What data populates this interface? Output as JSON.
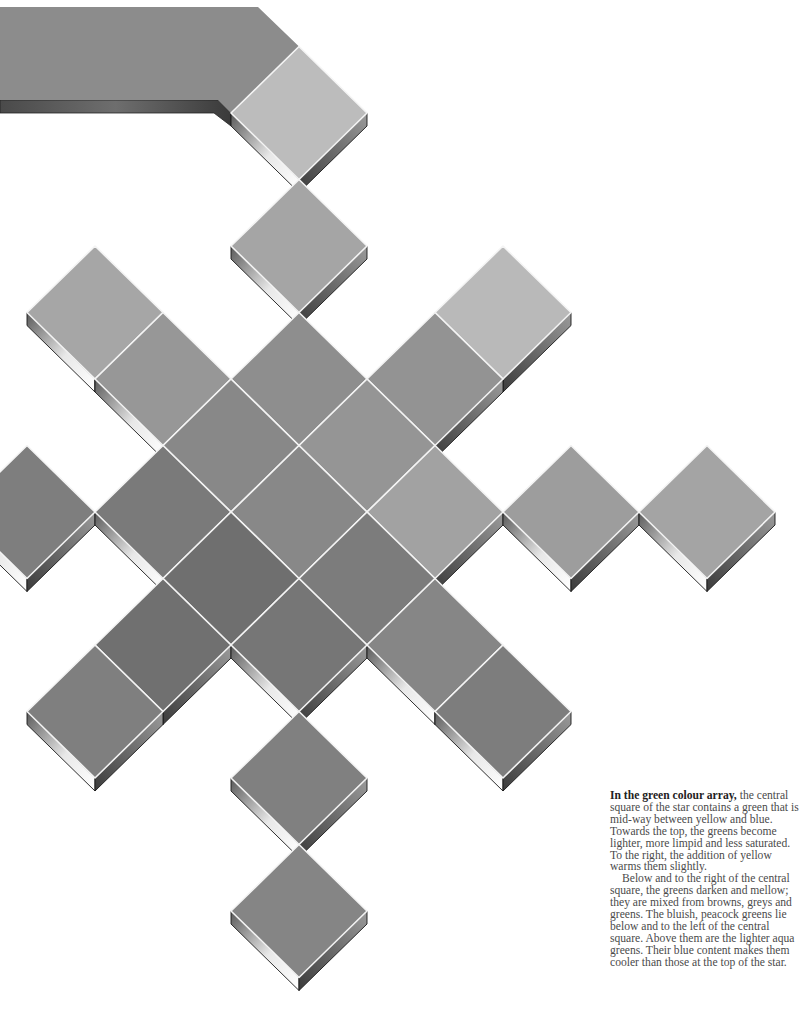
{
  "page": {
    "background": "#ffffff"
  },
  "caption": {
    "lead": "In the green colour array,",
    "p1": " the central square of the star contains a green that is mid-way between yellow and blue. Towards the top, the greens become lighter, more limpid and less saturated. To the right, the addition of yellow warms them slightly.",
    "p2": "Below and to the right of the central square, the greens darken and mellow; they are mixed from browns, greys and greens. The bluish, peacock greens lie below and to the left of the central square. Above them are the lighter aqua greens. Their blue content makes them cooler than those at the top of the star."
  },
  "grid": {
    "origin_x": 299,
    "origin_y": 512,
    "step_x": 68,
    "step_y": 66.5,
    "half_w": 68,
    "half_h": 66.5,
    "thickness": 13,
    "seam_color": "#f4f4f4"
  },
  "band": {
    "fill": "#8c8c8c",
    "top_y": 7,
    "bottom_y": 100,
    "top_corner_x": 258,
    "bottom_corner_x": 218
  },
  "tiles": [
    {
      "i": 0,
      "j": -6,
      "fill": "#bcbcbc",
      "name": "top-tile-lightest"
    },
    {
      "i": 0,
      "j": -4,
      "fill": "#a5a5a5",
      "name": "top-tile-2"
    },
    {
      "i": 0,
      "j": -2,
      "fill": "#8e8e8e",
      "name": "top-tile-3"
    },
    {
      "i": -3,
      "j": -3,
      "fill": "#a6a6a6",
      "name": "upper-left-arm-outer"
    },
    {
      "i": -2,
      "j": -2,
      "fill": "#979797",
      "name": "upper-left-arm-inner"
    },
    {
      "i": -1,
      "j": -1,
      "fill": "#888888",
      "name": "upper-left-neighbor"
    },
    {
      "i": 3,
      "j": -3,
      "fill": "#b9b9b9",
      "name": "upper-right-arm-outer"
    },
    {
      "i": 2,
      "j": -2,
      "fill": "#939393",
      "name": "upper-right-arm-inner"
    },
    {
      "i": 1,
      "j": -1,
      "fill": "#959595",
      "name": "upper-right-neighbor"
    },
    {
      "i": -4,
      "j": 0,
      "fill": "#7e7e7e",
      "name": "left-arm-outer"
    },
    {
      "i": -2,
      "j": 0,
      "fill": "#7a7a7a",
      "name": "left-arm-inner"
    },
    {
      "i": 0,
      "j": 0,
      "fill": "#888888",
      "name": "central-square"
    },
    {
      "i": 2,
      "j": 0,
      "fill": "#a2a2a2",
      "name": "right-arm-inner"
    },
    {
      "i": 4,
      "j": 0,
      "fill": "#9d9d9d",
      "name": "right-arm-mid"
    },
    {
      "i": 6,
      "j": 0,
      "fill": "#a4a4a4",
      "name": "right-arm-outer"
    },
    {
      "i": -1,
      "j": 1,
      "fill": "#6f6f6f",
      "name": "lower-left-neighbor"
    },
    {
      "i": -2,
      "j": 2,
      "fill": "#707070",
      "name": "lower-left-arm-inner"
    },
    {
      "i": -3,
      "j": 3,
      "fill": "#7f7f7f",
      "name": "lower-left-arm-outer"
    },
    {
      "i": 1,
      "j": 1,
      "fill": "#7c7c7c",
      "name": "lower-right-neighbor"
    },
    {
      "i": 2,
      "j": 2,
      "fill": "#868686",
      "name": "lower-right-arm-inner"
    },
    {
      "i": 3,
      "j": 3,
      "fill": "#7d7d7d",
      "name": "lower-right-arm-outer"
    },
    {
      "i": 0,
      "j": 2,
      "fill": "#767676",
      "name": "bottom-tile-1"
    },
    {
      "i": 0,
      "j": 4,
      "fill": "#808080",
      "name": "bottom-tile-2"
    },
    {
      "i": 0,
      "j": 6,
      "fill": "#858585",
      "name": "bottom-tile-3"
    }
  ]
}
